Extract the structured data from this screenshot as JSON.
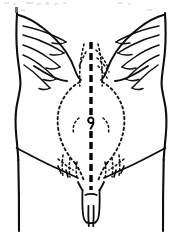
{
  "figure": {
    "title": "Anterior abdominal wall with midline incision",
    "view": "anterior",
    "background_color": "#ffffff",
    "line_color": "#101010",
    "width_px": 182,
    "height_px": 234
  },
  "regions": {
    "rib_cage_left_label": "left costal margin and ribs",
    "rib_cage_right_label": "right costal margin and ribs",
    "torso_outline_label": "abdominal wall outline",
    "midline_incision_label": "midline laparotomy incision",
    "navel_label": "umbilicus",
    "organ_outline_label": "underlying viscera outline",
    "inguinal_left_label": "left inguinal ligament",
    "inguinal_right_label": "right inguinal ligament",
    "genitalia_label": "external genitalia",
    "thigh_left_label": "left thigh",
    "thigh_right_label": "right thigh"
  },
  "rib_counts": {
    "left": 5,
    "right": 5
  },
  "scan_artifacts": {
    "top_smudge_present": true,
    "description": "faint grey scanning marks along the top edge"
  }
}
